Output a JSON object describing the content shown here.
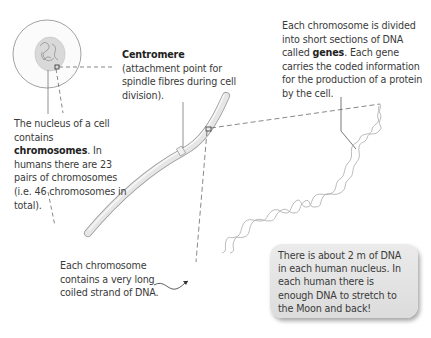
{
  "diagram": {
    "labels": {
      "nucleus": {
        "pre": "The nucleus of a cell contains ",
        "bold": "chromosomes",
        "post": ". In humans there are 23 pairs of chromosomes (i.e. 46 chromosomes in total)."
      },
      "centromere": {
        "bold": "Centromere",
        "post": " (attachment point for spindle fibres during cell division)."
      },
      "genes": {
        "pre": "Each chromosome is divided into short sections of DNA called ",
        "bold": "genes",
        "post": ". Each gene carries the coded information for the production of a protein by the cell."
      },
      "dna_strand": {
        "text": "Each chromosome contains a very long coiled strand of DNA."
      }
    },
    "note_box": {
      "text": "There is about 2 m of DNA in each human nucleus. In each human there is enough DNA to stretch to the Moon and back!",
      "background": "#e3e3e3"
    },
    "colors": {
      "text": "#3a3a3a",
      "lines": "#555555",
      "chromosome_fill": "#e4e4e4",
      "chromosome_edge": "#9a9a9a",
      "dna_strand": "#a8a8a8"
    }
  }
}
